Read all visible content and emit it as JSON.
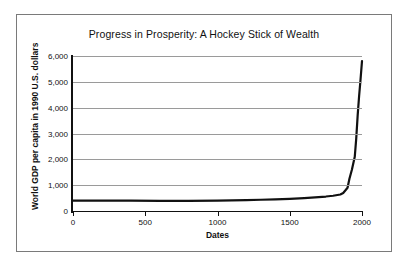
{
  "chart_data": {
    "type": "line",
    "title": "Progress in Prosperity: A Hockey Stick of Wealth",
    "xlabel": "Dates",
    "ylabel": "World GDP per capita in 1990 U.S. dollars",
    "xlim": [
      0,
      2000
    ],
    "ylim": [
      0,
      6000
    ],
    "grid": true,
    "legend": "none",
    "x_ticks": [
      "0",
      "500",
      "1000",
      "1500",
      "2000"
    ],
    "x_tick_values": [
      0,
      500,
      1000,
      1500,
      2000
    ],
    "y_ticks": [
      "0",
      "1,000",
      "2,000",
      "3,000",
      "4,000",
      "5,000",
      "6,000"
    ],
    "y_tick_values": [
      0,
      1000,
      2000,
      3000,
      4000,
      5000,
      6000
    ],
    "series": [
      {
        "name": "World GDP per capita",
        "color": "#111111",
        "x": [
          0,
          200,
          400,
          600,
          800,
          1000,
          1100,
          1200,
          1300,
          1400,
          1500,
          1600,
          1700,
          1750,
          1800,
          1850,
          1870,
          1900,
          1913,
          1930,
          1950,
          1960,
          1970,
          1980,
          1990,
          2000
        ],
        "y": [
          400,
          400,
          400,
          395,
          395,
          400,
          410,
          420,
          435,
          450,
          470,
          500,
          540,
          560,
          590,
          640,
          700,
          900,
          1250,
          1600,
          2100,
          2800,
          3700,
          4450,
          5100,
          5800
        ]
      }
    ]
  },
  "figure": {
    "background_color": "#ffffff",
    "border_color": "#7a7a7a",
    "gridline_color": "#9a9a9a",
    "axis_color": "#111111"
  }
}
